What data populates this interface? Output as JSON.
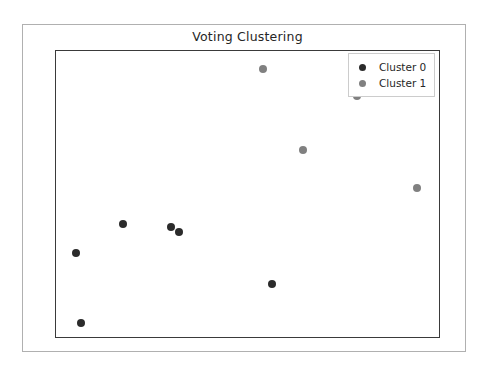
{
  "chart_data": {
    "type": "scatter",
    "title": "Voting Clustering",
    "xlabel": "",
    "ylabel": "",
    "grid": false,
    "xlim": [
      0,
      1
    ],
    "ylim": [
      0,
      1
    ],
    "xticks": [],
    "yticks": [],
    "legend_position": "upper right",
    "colors": {
      "cluster_0": "#2b2b2b",
      "cluster_1": "#808080",
      "axes_edge": "#3a3a3a",
      "figure_edge": "#b0b0b0",
      "legend_edge": "#cccccc",
      "background": "#ffffff",
      "text": "#262626"
    },
    "series": [
      {
        "name": "Cluster 0",
        "color": "#2b2b2b",
        "marker": "circle",
        "marker_size": 8,
        "points": [
          {
            "x": 0.174,
            "y": 0.396
          },
          {
            "x": 0.299,
            "y": 0.385
          },
          {
            "x": 0.322,
            "y": 0.368
          },
          {
            "x": 0.052,
            "y": 0.292
          },
          {
            "x": 0.564,
            "y": 0.184
          },
          {
            "x": 0.065,
            "y": 0.049
          }
        ]
      },
      {
        "name": "Cluster 1",
        "color": "#808080",
        "marker": "circle",
        "marker_size": 8,
        "points": [
          {
            "x": 0.541,
            "y": 0.938
          },
          {
            "x": 0.787,
            "y": 0.844
          },
          {
            "x": 0.645,
            "y": 0.653
          },
          {
            "x": 0.943,
            "y": 0.521
          }
        ]
      }
    ],
    "legend": [
      {
        "label": "Cluster 0",
        "color": "#2b2b2b"
      },
      {
        "label": "Cluster 1",
        "color": "#808080"
      }
    ]
  }
}
